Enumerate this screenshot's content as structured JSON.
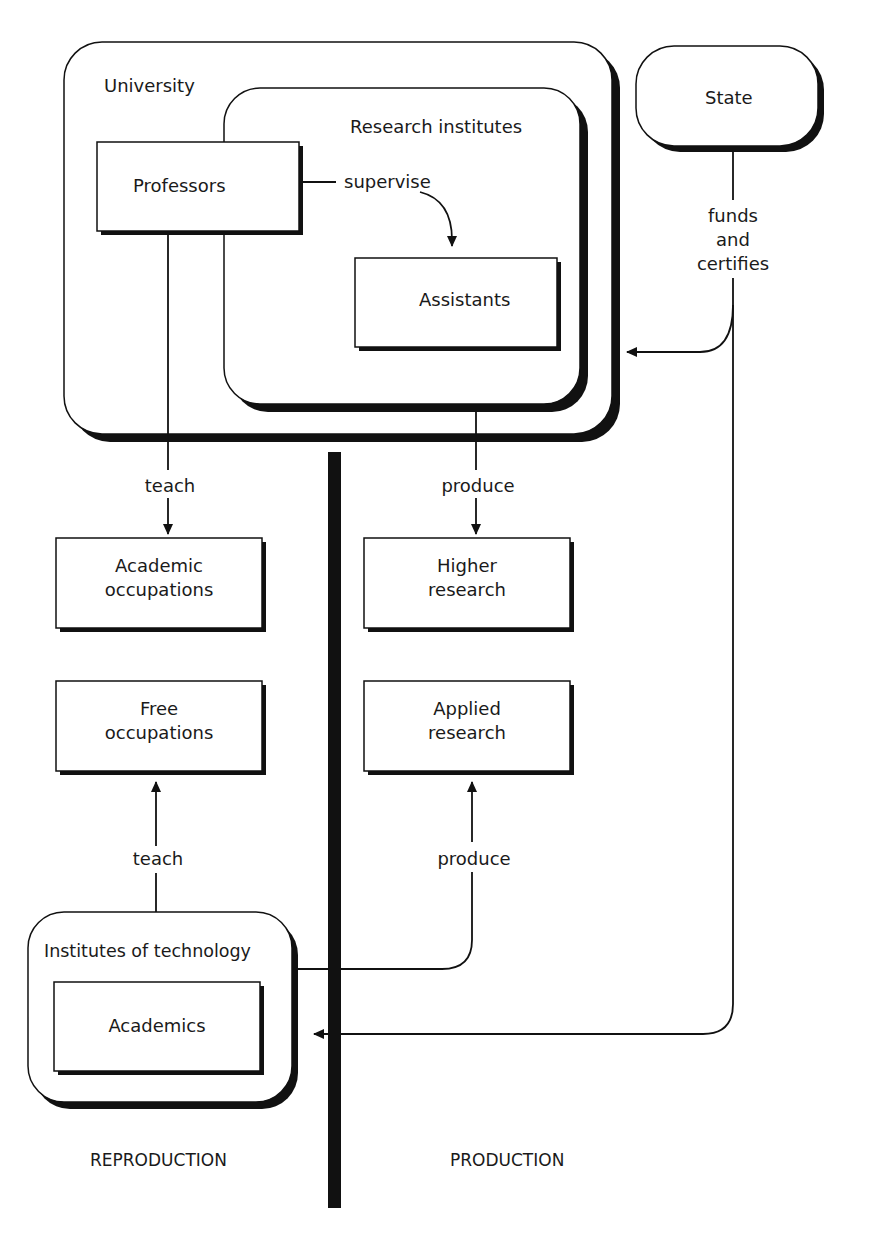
{
  "diagram": {
    "containers": {
      "university": "University",
      "research_institutes": "Research institutes",
      "state": "State",
      "institutes_of_technology": "Institutes of technology"
    },
    "boxes": {
      "professors": "Professors",
      "assistants": "Assistants",
      "academic_occupations": [
        "Academic",
        "occupations"
      ],
      "higher_research": [
        "Higher",
        "research"
      ],
      "free_occupations": [
        "Free",
        "occupations"
      ],
      "applied_research": [
        "Applied",
        "research"
      ],
      "academics": "Academics"
    },
    "edges": {
      "supervise": "supervise",
      "funds_and_certifies": [
        "funds",
        "and",
        "certifies"
      ],
      "teach_top": "teach",
      "produce_top": "produce",
      "teach_bottom": "teach",
      "produce_bottom": "produce"
    },
    "sections": {
      "left": "REPRODUCTION",
      "right": "PRODUCTION"
    },
    "colors": {
      "stroke": "#111111",
      "shadow": "#0a0a0a",
      "background": "#ffffff"
    }
  }
}
